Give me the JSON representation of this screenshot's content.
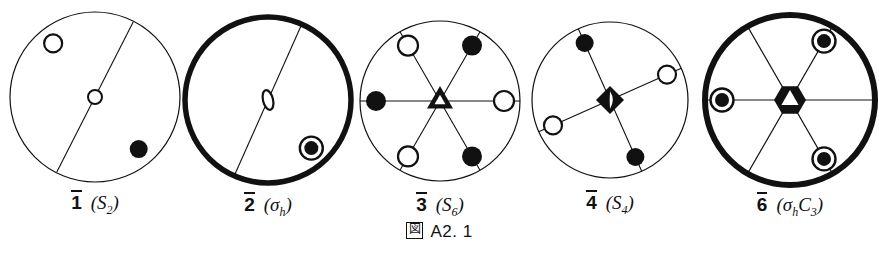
{
  "figure": {
    "caption_mark": "図",
    "caption_text": "A2. 1",
    "background": "#ffffff",
    "ink": "#111111"
  },
  "diagrams": [
    {
      "id": "s2",
      "name": "diagram-1-bar-S2",
      "label_number": "1",
      "label_symbol_open": "(",
      "label_symbol_main": "S",
      "label_symbol_sub": "2",
      "label_symbol_close": ")",
      "outer_circle": {
        "cx": 95,
        "cy": 97,
        "r": 85,
        "stroke_width": 1.2,
        "bold": false
      },
      "center_symbol": {
        "type": "open-circle",
        "r": 7
      },
      "lines": [
        {
          "angle_deg": 63,
          "length_frac": 0.99
        }
      ],
      "sites": [
        {
          "angle_deg": 128,
          "r_frac": 0.8,
          "fill": "open",
          "ring": false,
          "radius": 9
        },
        {
          "angle_deg": -50,
          "r_frac": 0.8,
          "fill": "filled",
          "ring": false,
          "radius": 9
        }
      ]
    },
    {
      "id": "sigma-h",
      "name": "diagram-2-bar-sigma-h",
      "label_number": "2",
      "label_symbol_open": "(",
      "label_symbol_main": "σ",
      "label_symbol_sub": "h",
      "label_symbol_close": ")",
      "outer_circle": {
        "cx": 268,
        "cy": 100,
        "r": 83,
        "stroke_width": 5.5,
        "bold": true
      },
      "center_symbol": {
        "type": "open-lens",
        "rx": 5,
        "ry": 10
      },
      "lines": [
        {
          "angle_deg": 66,
          "length_frac": 0.99
        }
      ],
      "sites": [
        {
          "angle_deg": -48,
          "r_frac": 0.78,
          "fill": "filled",
          "ring": true,
          "radius": 11
        }
      ]
    },
    {
      "id": "s6",
      "name": "diagram-3-bar-S6",
      "label_number": "3",
      "label_symbol_open": "(",
      "label_symbol_main": "S",
      "label_symbol_sub": "6",
      "label_symbol_close": ")",
      "outer_circle": {
        "cx": 440,
        "cy": 101,
        "r": 80,
        "stroke_width": 1.2,
        "bold": false
      },
      "center_symbol": {
        "type": "triangle-open-center",
        "r": 15
      },
      "lines": [
        {
          "angle_deg": 0,
          "length_frac": 1.0
        },
        {
          "angle_deg": 60,
          "length_frac": 1.0
        },
        {
          "angle_deg": 120,
          "length_frac": 1.0
        }
      ],
      "sites": [
        {
          "angle_deg": 60,
          "r_frac": 0.8,
          "fill": "filled",
          "ring": false,
          "radius": 10
        },
        {
          "angle_deg": 120,
          "r_frac": 0.8,
          "fill": "open",
          "ring": false,
          "radius": 10
        },
        {
          "angle_deg": 180,
          "r_frac": 0.8,
          "fill": "filled",
          "ring": false,
          "radius": 10
        },
        {
          "angle_deg": 240,
          "r_frac": 0.8,
          "fill": "open",
          "ring": false,
          "radius": 10
        },
        {
          "angle_deg": 300,
          "r_frac": 0.8,
          "fill": "filled",
          "ring": false,
          "radius": 10
        },
        {
          "angle_deg": 0,
          "r_frac": 0.8,
          "fill": "open",
          "ring": false,
          "radius": 10
        }
      ]
    },
    {
      "id": "s4",
      "name": "diagram-4-bar-S4",
      "label_number": "4",
      "label_symbol_open": "(",
      "label_symbol_main": "S",
      "label_symbol_sub": "4",
      "label_symbol_close": ")",
      "outer_circle": {
        "cx": 610,
        "cy": 100,
        "r": 78,
        "stroke_width": 1.2,
        "bold": false
      },
      "center_symbol": {
        "type": "filled-square-open-lens",
        "r": 14
      },
      "lines": [
        {
          "angle_deg": 24,
          "length_frac": 1.0
        },
        {
          "angle_deg": 114,
          "length_frac": 1.0
        }
      ],
      "sites": [
        {
          "angle_deg": 24,
          "r_frac": 0.8,
          "fill": "open",
          "ring": false,
          "radius": 9
        },
        {
          "angle_deg": 114,
          "r_frac": 0.8,
          "fill": "filled",
          "ring": false,
          "radius": 9
        },
        {
          "angle_deg": 204,
          "r_frac": 0.8,
          "fill": "open",
          "ring": false,
          "radius": 9
        },
        {
          "angle_deg": 294,
          "r_frac": 0.8,
          "fill": "filled",
          "ring": false,
          "radius": 9
        }
      ]
    },
    {
      "id": "sigma-h-c3",
      "name": "diagram-5-bar-sigma-h-C3",
      "label_number": "6",
      "label_symbol_open": "(",
      "label_symbol_main": "σ",
      "label_symbol_sub": "h",
      "label_symbol_main2": "C",
      "label_symbol_sub2": "3",
      "label_symbol_close": ")",
      "outer_circle": {
        "cx": 790,
        "cy": 100,
        "r": 85,
        "stroke_width": 6,
        "bold": true
      },
      "center_symbol": {
        "type": "filled-hexagon-open-triangle",
        "r": 16
      },
      "lines": [
        {
          "angle_deg": 0,
          "length_frac": 1.0
        },
        {
          "angle_deg": 60,
          "length_frac": 1.0
        },
        {
          "angle_deg": 120,
          "length_frac": 1.0
        }
      ],
      "sites": [
        {
          "angle_deg": 60,
          "r_frac": 0.8,
          "fill": "filled",
          "ring": true,
          "radius": 11
        },
        {
          "angle_deg": 180,
          "r_frac": 0.8,
          "fill": "filled",
          "ring": true,
          "radius": 11
        },
        {
          "angle_deg": 300,
          "r_frac": 0.8,
          "fill": "filled",
          "ring": true,
          "radius": 11
        }
      ]
    }
  ],
  "labels": [
    {
      "x": 95,
      "y": 190,
      "number": "1",
      "symbol": "(S2)"
    },
    {
      "x": 268,
      "y": 192,
      "number": "2",
      "symbol": "(σh)"
    },
    {
      "x": 440,
      "y": 192,
      "number": "3",
      "symbol": "(S6)"
    },
    {
      "x": 610,
      "y": 190,
      "number": "4",
      "symbol": "(S4)"
    },
    {
      "x": 790,
      "y": 192,
      "number": "6",
      "symbol": "(σhC3)"
    }
  ],
  "caption_position": {
    "y": 222
  }
}
